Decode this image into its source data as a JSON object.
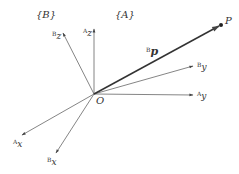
{
  "diagram": {
    "frames": {
      "B": "{B}",
      "A": "{A}"
    },
    "origin": {
      "label": "O",
      "x": 94,
      "y": 94
    },
    "axes": [
      {
        "id": "Az",
        "sup": "A",
        "sub": "z",
        "tip": [
          94,
          28
        ],
        "label_pos": [
          83,
          34
        ]
      },
      {
        "id": "Bz",
        "sup": "B",
        "sub": "z",
        "tip": [
          63,
          32
        ],
        "label_pos": [
          52,
          38
        ]
      },
      {
        "id": "Ay",
        "sup": "A",
        "sub": "y",
        "tip": [
          194,
          95
        ],
        "label_pos": [
          197,
          99
        ]
      },
      {
        "id": "By",
        "sup": "B",
        "sub": "y",
        "tip": [
          194,
          66
        ],
        "label_pos": [
          197,
          69
        ]
      },
      {
        "id": "Ax",
        "sup": "A",
        "sub": "x",
        "tip": [
          22,
          135
        ],
        "label_pos": [
          14,
          147
        ]
      },
      {
        "id": "Bx",
        "sup": "B",
        "sub": "x",
        "tip": [
          56,
          153
        ],
        "label_pos": [
          48,
          165
        ]
      }
    ],
    "vector": {
      "sup": "B",
      "name": "p",
      "tip": [
        221,
        25
      ]
    },
    "point": {
      "label": "P",
      "x": 221,
      "y": 25
    },
    "colors": {
      "line": "#555555",
      "vector": "#333333",
      "text": "#333333"
    }
  }
}
